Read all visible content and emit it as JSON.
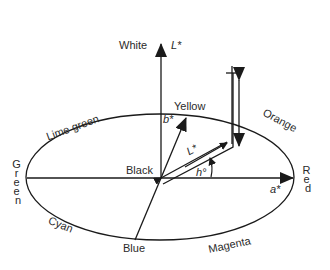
{
  "diagram": {
    "axes": {
      "vertical": "L*",
      "horizontal": "a*",
      "oblique": "b*",
      "chroma_vector": "L*",
      "hue_angle": "h°"
    },
    "poles": {
      "top": "White",
      "center": "Black"
    },
    "hues": {
      "yellow": "Yellow",
      "orange": "Orange",
      "red": "Red",
      "magenta": "Magenta",
      "blue": "Blue",
      "cyan": "Cyan",
      "green": "Green",
      "lime_green": "Lime green"
    },
    "colors": {
      "stroke": "#1a1a1a",
      "text": "#2a2a2a",
      "background": "#ffffff"
    }
  }
}
